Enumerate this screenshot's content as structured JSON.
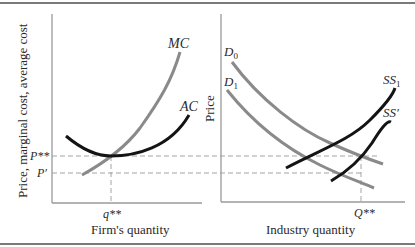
{
  "left_panel": {
    "ylabel": "Price, marginal cost, average cost",
    "xlabel": "Firm's quantity",
    "curves": {
      "mc": "MC",
      "ac": "AC"
    },
    "price_labels": {
      "p_star": "P**",
      "p_prime": "P′"
    },
    "quantity_label": "q**"
  },
  "right_panel": {
    "ylabel": "Price",
    "xlabel": "Industry quantity",
    "curves": {
      "d0": "D",
      "d0_sub": "0",
      "d1": "D",
      "d1_sub": "1",
      "ss1": "SS",
      "ss1_sub": "1",
      "ssp": "SS′"
    },
    "quantity_label": "Q**"
  },
  "colors": {
    "gray_curve": "#8a8a8a",
    "black_curve": "#141414",
    "axis": "#9a9a9a",
    "dash": "#9a9a9a",
    "border": "#7a7a7a"
  }
}
